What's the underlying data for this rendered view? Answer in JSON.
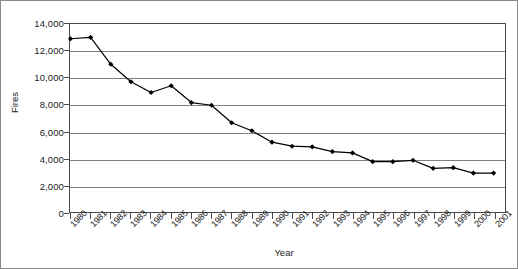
{
  "chart_data": {
    "type": "line",
    "title": "",
    "xlabel": "Year",
    "ylabel": "Fires",
    "categories": [
      "1980",
      "1981",
      "1982",
      "1983",
      "1984",
      "1985",
      "1986",
      "1987",
      "1988",
      "1989",
      "1990",
      "1991",
      "1992",
      "1993",
      "1994",
      "1995",
      "1996",
      "1997",
      "1998",
      "1999",
      "2000",
      "2001"
    ],
    "values": [
      12900,
      13000,
      11000,
      9700,
      8900,
      9400,
      8150,
      7950,
      6650,
      6050,
      5200,
      4900,
      4850,
      4500,
      4400,
      3750,
      3750,
      3850,
      3250,
      3300,
      2900,
      2900
    ],
    "series": [
      {
        "name": "Fires",
        "values": [
          12900,
          13000,
          11000,
          9700,
          8900,
          9400,
          8150,
          7950,
          6650,
          6050,
          5200,
          4900,
          4850,
          4500,
          4400,
          3750,
          3750,
          3850,
          3250,
          3300,
          2900,
          2900
        ]
      }
    ],
    "ylim": [
      0,
      14000
    ],
    "ytick_labels": [
      "14,000",
      "12,000",
      "10,000",
      "8,000",
      "6,000",
      "4,000",
      "2,000",
      "0"
    ],
    "ytick_values": [
      14000,
      12000,
      10000,
      8000,
      6000,
      4000,
      2000,
      0
    ],
    "ystep": 2000,
    "grid": "horizontal",
    "legend": "none",
    "marker": "diamond",
    "line_color": "#000000",
    "marker_color": "#000000",
    "grid_color": "#808080",
    "axis_color": "#4a4a4a",
    "background_color": "#ffffff"
  }
}
